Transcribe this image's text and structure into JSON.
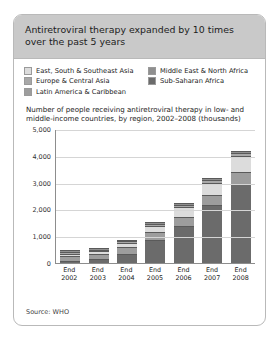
{
  "card": {
    "title": "Antiretroviral therapy expanded by 10 times over the past 5 years",
    "subtitle": "Number of people receiving antiretroviral therapy in low- and middle-income countries, by region, 2002–2008 (thousands)",
    "source": "Source: WHO"
  },
  "legend": {
    "items": [
      {
        "label": "East, South & Southeast Asia",
        "color": "#dcdcdc"
      },
      {
        "label": "Middle East & North Africa",
        "color": "#8f8f8f"
      },
      {
        "label": "Europe & Central Asia",
        "color": "#a8a8a8"
      },
      {
        "label": "Sub-Saharan Africa",
        "color": "#6b6b6b"
      },
      {
        "label": "Latin America & Caribbean",
        "color": "#9d9d9d"
      }
    ]
  },
  "chart_data": {
    "type": "bar",
    "subtype": "stacked-column",
    "title": "Antiretroviral therapy expanded by 10 times over the past 5 years",
    "subtitle": "Number of people receiving antiretroviral therapy in low- and middle-income countries, by region, 2002–2008 (thousands)",
    "xlabel": "",
    "ylabel": "",
    "ylim": [
      0,
      5000
    ],
    "yticks": [
      "0",
      "1,000",
      "2,000",
      "3,000",
      "4,000",
      "5,000"
    ],
    "ytick_values": [
      0,
      1000,
      2000,
      3000,
      4000,
      5000
    ],
    "grid": true,
    "legend_position": "top",
    "categories": [
      "End 2002",
      "End 2003",
      "End 2004",
      "End 2005",
      "End 2006",
      "End 2007",
      "End 2008"
    ],
    "category_lines": [
      [
        "End",
        "2002"
      ],
      [
        "End",
        "2003"
      ],
      [
        "End",
        "2004"
      ],
      [
        "End",
        "2005"
      ],
      [
        "End",
        "2006"
      ],
      [
        "End",
        "2007"
      ],
      [
        "End",
        "2008"
      ]
    ],
    "series": [
      {
        "name": "Sub-Saharan Africa",
        "color": "#6b6b6b",
        "values": [
          50,
          100,
          310,
          810,
          1330,
          2120,
          2925
        ]
      },
      {
        "name": "Latin America & Caribbean",
        "color": "#9d9d9d",
        "values": [
          140,
          165,
          205,
          255,
          305,
          350,
          390
        ]
      },
      {
        "name": "East, South & Southeast Asia",
        "color": "#dcdcdc",
        "values": [
          45,
          60,
          115,
          200,
          340,
          420,
          565
        ]
      },
      {
        "name": "Europe & Central Asia",
        "color": "#a8a8a8",
        "values": [
          7,
          12,
          22,
          35,
          55,
          75,
          95
        ]
      },
      {
        "name": "Middle East & North Africa",
        "color": "#8f8f8f",
        "values": [
          3,
          4,
          5,
          7,
          9,
          11,
          13
        ]
      }
    ],
    "totals": [
      245,
      341,
      657,
      1307,
      2039,
      2976,
      3988
    ]
  }
}
